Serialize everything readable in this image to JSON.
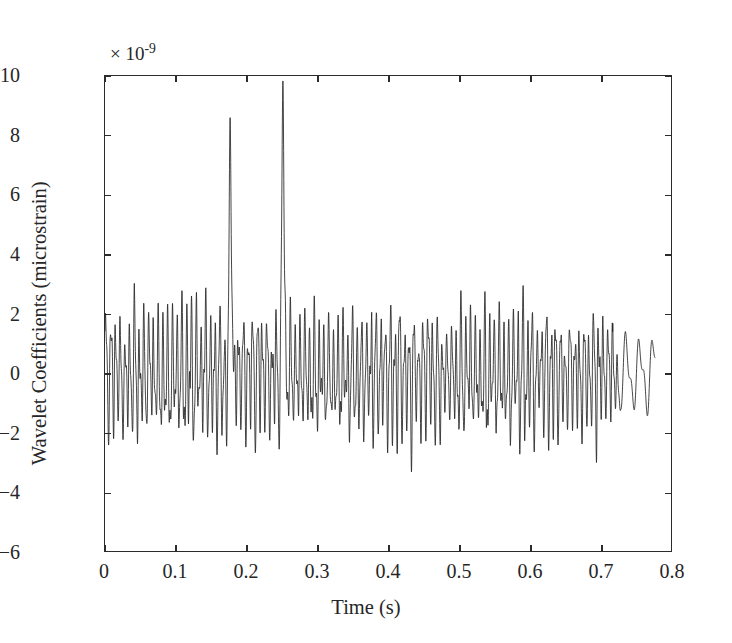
{
  "chart_data": {
    "type": "line",
    "title": "",
    "xlabel": "Time (s)",
    "ylabel": "Wavelet Coefficients (microstrain)",
    "y_multiplier_label": "× 10",
    "y_multiplier_exponent": "-9",
    "y_scale_factor": 1e-09,
    "xlim": [
      0,
      0.8
    ],
    "ylim": [
      -6,
      10
    ],
    "xticks": [
      0,
      0.1,
      0.2,
      0.3,
      0.4,
      0.5,
      0.6,
      0.7,
      0.8
    ],
    "xtick_labels": [
      "0",
      "0.1",
      "0.2",
      "0.3",
      "0.4",
      "0.5",
      "0.6",
      "0.7",
      "0.8"
    ],
    "yticks": [
      -6,
      -4,
      -2,
      0,
      2,
      4,
      6,
      8,
      10
    ],
    "ytick_labels": [
      "−6",
      "−4",
      "−2",
      "0",
      "2",
      "4",
      "6",
      "8",
      "10"
    ],
    "grid": false,
    "legend": null,
    "line_color": "#262626",
    "line_width": 0.85,
    "background_color": "#ffffff",
    "frame_color": "#2b2b2b",
    "series": [
      {
        "name": "Wavelet Coefficients",
        "x_start": 0.0,
        "x_end": 0.775,
        "n_points": 3100,
        "baseline_amplitude": 1.85,
        "carrier_frequency_hz": 150,
        "tail_start_time": 0.715,
        "tail_frequency_hz": 52,
        "tail_amplitude": 1.55,
        "spikes": [
          {
            "time": 0.177,
            "peak_positive": 8.0,
            "peak_negative": -4.3,
            "width": 0.0045
          },
          {
            "time": 0.251,
            "peak_positive": 9.8,
            "peak_negative": -5.3,
            "width": 0.0042
          }
        ]
      }
    ]
  }
}
